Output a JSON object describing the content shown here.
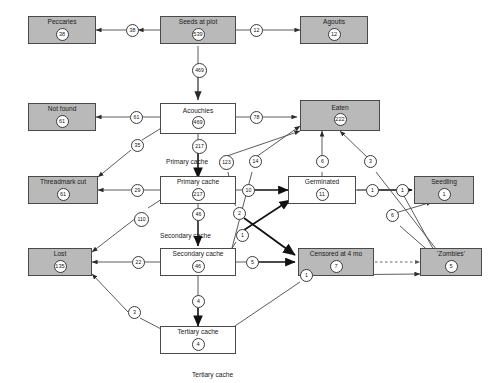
{
  "diagram": {
    "bottom_caption": "Tertiary cache",
    "colors": {
      "terminal_fill": "#b9b9b9",
      "transient_fill": "#ffffff",
      "stroke": "#4a4a4a"
    },
    "nodes": [
      {
        "id": "peccaries",
        "label": "Peccaries",
        "value": "38",
        "type": "terminal"
      },
      {
        "id": "seeds",
        "label": "Seeds at plot",
        "value": "539",
        "type": "terminal"
      },
      {
        "id": "agoutis",
        "label": "Agoutis",
        "value": "12",
        "type": "terminal"
      },
      {
        "id": "notfound",
        "label": "Not found",
        "value": "61",
        "type": "terminal"
      },
      {
        "id": "acouchies",
        "label": "Acouchies",
        "value": "469",
        "type": "transient"
      },
      {
        "id": "eaten",
        "label": "Eaten",
        "value": "222",
        "type": "terminal"
      },
      {
        "id": "threadmark",
        "label": "Threadmark cut",
        "value": "61",
        "type": "terminal"
      },
      {
        "id": "primary",
        "label": "Primary cache",
        "value": "217",
        "type": "transient"
      },
      {
        "id": "germinated",
        "label": "Germinated",
        "value": "11",
        "type": "transient"
      },
      {
        "id": "seedling",
        "label": "Seedling",
        "value": "1",
        "type": "terminal"
      },
      {
        "id": "lost",
        "label": "Lost",
        "value": "135",
        "type": "terminal"
      },
      {
        "id": "secondary",
        "label": "Secondary cache",
        "value": "46",
        "type": "transient"
      },
      {
        "id": "censored",
        "label": "Censored at 4 mo",
        "value": "7",
        "type": "terminal"
      },
      {
        "id": "zombies",
        "label": "'Zombies'",
        "value": "5",
        "type": "terminal"
      },
      {
        "id": "tertiary",
        "label": "Tertiary cache",
        "value": "4",
        "type": "transient"
      }
    ],
    "stage_labels": [
      {
        "id": "stage-primary",
        "text": "Primary cache"
      },
      {
        "id": "stage-secondary",
        "text": "Secondary cache"
      }
    ],
    "edges": [
      {
        "from": "seeds",
        "to": "peccaries",
        "value": "38"
      },
      {
        "from": "seeds",
        "to": "agoutis",
        "value": "12"
      },
      {
        "from": "seeds",
        "to": "acouchies",
        "value": "469"
      },
      {
        "from": "acouchies",
        "to": "notfound",
        "value": "61"
      },
      {
        "from": "acouchies",
        "to": "eaten",
        "value": "78"
      },
      {
        "from": "acouchies",
        "to": "threadmark",
        "value": "35"
      },
      {
        "from": "acouchies",
        "to": "primary",
        "value": "217"
      },
      {
        "from": "primary",
        "to": "threadmark",
        "value": "29"
      },
      {
        "from": "primary",
        "to": "eaten",
        "value": "123"
      },
      {
        "from": "primary",
        "to": "germinated",
        "value": "10"
      },
      {
        "from": "primary",
        "to": "lost",
        "value": "110"
      },
      {
        "from": "primary",
        "to": "secondary",
        "value": "46"
      },
      {
        "from": "primary",
        "to": "censored",
        "value": "2"
      },
      {
        "from": "secondary",
        "to": "eaten",
        "value": "14"
      },
      {
        "from": "secondary",
        "to": "lost",
        "value": "22"
      },
      {
        "from": "secondary",
        "to": "germinated",
        "value": "1"
      },
      {
        "from": "secondary",
        "to": "censored",
        "value": "5"
      },
      {
        "from": "secondary",
        "to": "tertiary",
        "value": "4"
      },
      {
        "from": "tertiary",
        "to": "lost",
        "value": "3"
      },
      {
        "from": "tertiary",
        "to": "zombies",
        "value": "1"
      },
      {
        "from": "germinated",
        "to": "eaten",
        "value": "6"
      },
      {
        "from": "germinated",
        "to": "seedling",
        "value": "1"
      },
      {
        "from": "zombies",
        "to": "eaten",
        "value": "3"
      },
      {
        "from": "zombies",
        "to": "germinated",
        "value": "1"
      },
      {
        "from": "zombies",
        "to": "seedling",
        "value": "6"
      },
      {
        "from": "censored",
        "to": "zombies",
        "value": ""
      }
    ]
  }
}
